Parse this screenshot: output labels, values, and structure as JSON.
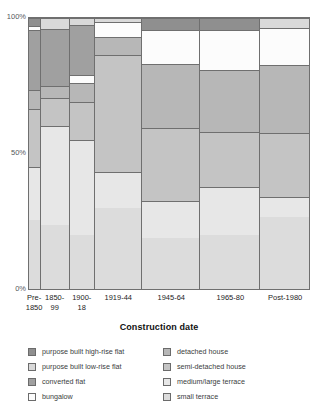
{
  "axes": {
    "x_title": "Construction date",
    "y_ticks": [
      "100%",
      "50%",
      "0%"
    ]
  },
  "chart_data": {
    "type": "bar",
    "subtype": "mosaic-marimekko-100pct-stacked",
    "title": "",
    "xlabel": "Construction date",
    "ylabel": "",
    "ylim": [
      0,
      100
    ],
    "y_tick_values": [
      0,
      50,
      100
    ],
    "y_tick_labels": [
      "0%",
      "50%",
      "100%"
    ],
    "grid": false,
    "legend_position": "bottom",
    "note": "Column widths are proportional to the share of total dwellings built in each period; segment heights are within-period percentages summing to 100.",
    "categories": [
      "Pre-1850",
      "1850-99",
      "1900-18",
      "1919-44",
      "1945-64",
      "1965-80",
      "Post-1980"
    ],
    "category_labels_wrapped": [
      "Pre-\n1850",
      "1850-\n99",
      "1900-\n18",
      "1919-44",
      "1945-64",
      "1965-80",
      "Post-1980"
    ],
    "column_widths_pct": [
      4.3,
      10.3,
      8.9,
      17.0,
      20.6,
      21.3,
      17.6
    ],
    "series": [
      {
        "name": "purpose built high-rise flat",
        "color": "#8f8f8f",
        "values": [
          3.0,
          0.0,
          0.0,
          0.0,
          4.5,
          4.5,
          0.0
        ]
      },
      {
        "name": "purpose built low-rise flat",
        "color": "#d9d9d9",
        "values": [
          0.0,
          4.0,
          2.5,
          1.5,
          0.0,
          0.0,
          3.5
        ]
      },
      {
        "name": "converted flat",
        "color": "#a0a0a0",
        "values": [
          22.0,
          21.0,
          18.5,
          0.0,
          0.0,
          0.0,
          0.0
        ]
      },
      {
        "name": "bungalow",
        "color": "#fcfcfc",
        "values": [
          1.5,
          0.0,
          3.0,
          5.5,
          12.5,
          14.5,
          14.0
        ]
      },
      {
        "name": "detached house",
        "color": "#b7b7b7",
        "values": [
          7.0,
          4.5,
          7.0,
          6.5,
          23.5,
          23.0,
          25.0
        ]
      },
      {
        "name": "semi-detached house",
        "color": "#c4c4c4",
        "values": [
          21.5,
          10.5,
          14.0,
          43.5,
          27.0,
          20.5,
          23.5
        ]
      },
      {
        "name": "medium/large terrace",
        "color": "#e7e7e7",
        "values": [
          19.5,
          36.5,
          35.0,
          13.0,
          13.5,
          17.5,
          7.5
        ]
      },
      {
        "name": "small terrace",
        "color": "#dcdcdc",
        "values": [
          25.5,
          23.5,
          20.0,
          30.0,
          19.0,
          20.0,
          26.5
        ]
      }
    ],
    "stacked_segments_by_column": [
      {
        "category": "Pre-1850",
        "width_pct": 4.3,
        "segments": [
          {
            "name": "small terrace",
            "value": 25.5,
            "color": "#dcdcdc"
          },
          {
            "name": "medium/large terrace",
            "value": 19.5,
            "color": "#e7e7e7"
          },
          {
            "name": "semi-detached house",
            "value": 21.5,
            "color": "#c4c4c4"
          },
          {
            "name": "detached house",
            "value": 7.0,
            "color": "#b7b7b7"
          },
          {
            "name": "converted flat",
            "value": 22.0,
            "color": "#a0a0a0"
          },
          {
            "name": "bungalow",
            "value": 1.5,
            "color": "#fcfcfc"
          },
          {
            "name": "purpose built high-rise flat",
            "value": 3.0,
            "color": "#8f8f8f"
          }
        ]
      },
      {
        "category": "1850-99",
        "width_pct": 10.3,
        "segments": [
          {
            "name": "small terrace",
            "value": 23.5,
            "color": "#dcdcdc"
          },
          {
            "name": "medium/large terrace",
            "value": 36.5,
            "color": "#e7e7e7"
          },
          {
            "name": "semi-detached house",
            "value": 10.5,
            "color": "#c4c4c4"
          },
          {
            "name": "detached house",
            "value": 4.5,
            "color": "#b7b7b7"
          },
          {
            "name": "converted flat",
            "value": 21.0,
            "color": "#a0a0a0"
          },
          {
            "name": "purpose built low-rise flat",
            "value": 4.0,
            "color": "#d9d9d9"
          }
        ]
      },
      {
        "category": "1900-18",
        "width_pct": 8.9,
        "segments": [
          {
            "name": "small terrace",
            "value": 20.0,
            "color": "#dcdcdc"
          },
          {
            "name": "medium/large terrace",
            "value": 35.0,
            "color": "#e7e7e7"
          },
          {
            "name": "semi-detached house",
            "value": 14.0,
            "color": "#c4c4c4"
          },
          {
            "name": "detached house",
            "value": 7.0,
            "color": "#b7b7b7"
          },
          {
            "name": "bungalow",
            "value": 3.0,
            "color": "#fcfcfc"
          },
          {
            "name": "converted flat",
            "value": 18.5,
            "color": "#a0a0a0"
          },
          {
            "name": "purpose built low-rise flat",
            "value": 2.5,
            "color": "#d9d9d9"
          }
        ]
      },
      {
        "category": "1919-44",
        "width_pct": 17.0,
        "segments": [
          {
            "name": "small terrace",
            "value": 30.0,
            "color": "#dcdcdc"
          },
          {
            "name": "medium/large terrace",
            "value": 13.0,
            "color": "#e7e7e7"
          },
          {
            "name": "semi-detached house",
            "value": 43.5,
            "color": "#c4c4c4"
          },
          {
            "name": "detached house",
            "value": 6.5,
            "color": "#b7b7b7"
          },
          {
            "name": "bungalow",
            "value": 5.5,
            "color": "#fcfcfc"
          },
          {
            "name": "purpose built low-rise flat",
            "value": 1.5,
            "color": "#d9d9d9"
          }
        ]
      },
      {
        "category": "1945-64",
        "width_pct": 20.6,
        "segments": [
          {
            "name": "small terrace",
            "value": 19.0,
            "color": "#dcdcdc"
          },
          {
            "name": "medium/large terrace",
            "value": 13.5,
            "color": "#e7e7e7"
          },
          {
            "name": "semi-detached house",
            "value": 27.0,
            "color": "#c4c4c4"
          },
          {
            "name": "detached house",
            "value": 23.5,
            "color": "#b7b7b7"
          },
          {
            "name": "bungalow",
            "value": 12.5,
            "color": "#fcfcfc"
          },
          {
            "name": "purpose built high-rise flat",
            "value": 4.5,
            "color": "#8f8f8f"
          }
        ]
      },
      {
        "category": "1965-80",
        "width_pct": 21.3,
        "segments": [
          {
            "name": "small terrace",
            "value": 20.0,
            "color": "#dcdcdc"
          },
          {
            "name": "medium/large terrace",
            "value": 17.5,
            "color": "#e7e7e7"
          },
          {
            "name": "semi-detached house",
            "value": 20.5,
            "color": "#c4c4c4"
          },
          {
            "name": "detached house",
            "value": 23.0,
            "color": "#b7b7b7"
          },
          {
            "name": "bungalow",
            "value": 14.5,
            "color": "#fcfcfc"
          },
          {
            "name": "purpose built high-rise flat",
            "value": 4.5,
            "color": "#8f8f8f"
          }
        ]
      },
      {
        "category": "Post-1980",
        "width_pct": 17.6,
        "segments": [
          {
            "name": "small terrace",
            "value": 26.5,
            "color": "#dcdcdc"
          },
          {
            "name": "medium/large terrace",
            "value": 7.5,
            "color": "#e7e7e7"
          },
          {
            "name": "semi-detached house",
            "value": 23.5,
            "color": "#c4c4c4"
          },
          {
            "name": "detached house",
            "value": 25.0,
            "color": "#b7b7b7"
          },
          {
            "name": "bungalow",
            "value": 14.0,
            "color": "#fcfcfc"
          },
          {
            "name": "purpose built low-rise flat",
            "value": 3.5,
            "color": "#d9d9d9"
          }
        ]
      }
    ]
  },
  "legend": {
    "left_column": [
      {
        "label": "purpose built high-rise flat",
        "color": "#8f8f8f"
      },
      {
        "label": "purpose built low-rise flat",
        "color": "#d9d9d9"
      },
      {
        "label": "converted flat",
        "color": "#a0a0a0"
      },
      {
        "label": "bungalow",
        "color": "#fcfcfc"
      }
    ],
    "right_column": [
      {
        "label": "detached house",
        "color": "#b7b7b7"
      },
      {
        "label": "semi-detached house",
        "color": "#c4c4c4"
      },
      {
        "label": "medium/large terrace",
        "color": "#e7e7e7"
      },
      {
        "label": "small terrace",
        "color": "#dcdcdc"
      }
    ]
  }
}
